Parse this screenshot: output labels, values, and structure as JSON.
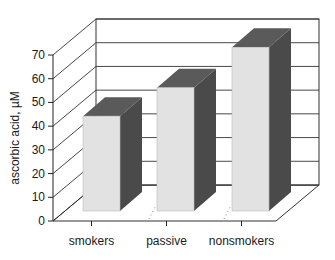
{
  "chart_data": {
    "type": "bar",
    "style": "3d",
    "title": "",
    "xlabel": "",
    "ylabel": "ascorbic acid, µM",
    "categories": [
      "smokers",
      "passive",
      "nonsmokers"
    ],
    "values": [
      40,
      52,
      69
    ],
    "ylim": [
      0,
      70
    ],
    "yticks": [
      0,
      10,
      20,
      30,
      40,
      50,
      60,
      70
    ],
    "grid": true,
    "legend": null
  },
  "colors": {
    "bar_front": "#e2e2e2",
    "bar_side": "#4a4a4a",
    "bar_top": "#5a5a5a",
    "axis": "#222222",
    "grid": "#333333"
  }
}
